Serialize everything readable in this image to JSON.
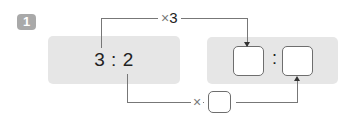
{
  "problem": {
    "number": "1",
    "left_ratio": "3 : 2",
    "right_colon": ":",
    "top_operator": "×",
    "top_multiplier": "3",
    "bottom_operator": "×",
    "bottom_multiplier_blank": ""
  },
  "colors": {
    "panel": "#e6e6e6",
    "badge": "#a9a9a9",
    "line": "#777777"
  }
}
